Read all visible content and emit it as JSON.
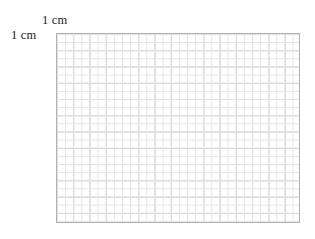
{
  "figure": {
    "name": "centimetre-graph-paper",
    "background_color": "#ffffff",
    "width_px": 315,
    "height_px": 239
  },
  "labels": {
    "top": {
      "text": "1 cm",
      "describes": "width of one major grid square",
      "color": "#1c1c1c"
    },
    "left": {
      "text": "1 cm",
      "describes": "height of one major grid square",
      "color": "#1c1c1c"
    }
  },
  "grid": {
    "border_color": "#b0b0b5",
    "major_line_color": "#c4c4c9",
    "minor_line_color": "#e3e3e6",
    "major_cell_px": 16.27,
    "minor_cell_px": 8.13,
    "columns_major": 15,
    "rows_major": 12,
    "left_px": 56,
    "top_px": 33,
    "width_px": 244,
    "height_px": 190
  }
}
